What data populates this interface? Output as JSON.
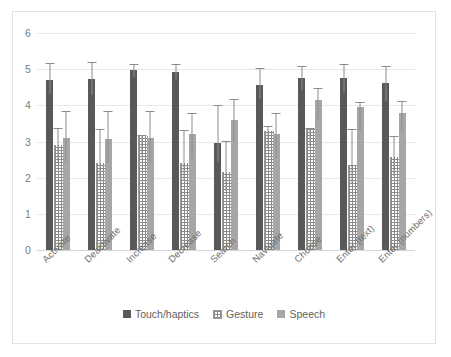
{
  "chart_data": {
    "type": "bar",
    "title": "",
    "subtitle": "",
    "xlabel": "",
    "ylabel": "",
    "ylim": [
      0,
      6
    ],
    "ytick_labels": [
      "0",
      "1",
      "2",
      "3",
      "4",
      "5",
      "6"
    ],
    "yticks": [
      0,
      1,
      2,
      3,
      4,
      5,
      6
    ],
    "grid": true,
    "legend_position": "bottom-center",
    "error_bars": true,
    "categories": [
      "Activate",
      "Deactivate",
      "Increase",
      "Decrease",
      "Search",
      "Navigate",
      "Choose",
      "Enter (text)",
      "Enter (numbers)"
    ],
    "series": [
      {
        "name": "Touch/haptics",
        "color": "#595959",
        "values": [
          4.7,
          4.72,
          4.97,
          4.93,
          2.97,
          4.57,
          4.75,
          4.75,
          4.62
        ],
        "err_low": [
          4.3,
          4.28,
          4.78,
          4.72,
          2.42,
          4.18,
          4.42,
          4.35,
          4.12
        ],
        "err_high": [
          5.18,
          5.2,
          5.15,
          5.13,
          4.02,
          5.02,
          5.1,
          5.13,
          5.1
        ]
      },
      {
        "name": "Gesture",
        "color": "#ffffff",
        "values": [
          2.9,
          2.4,
          3.15,
          2.4,
          2.15,
          3.3,
          3.35,
          2.35,
          2.58
        ],
        "err_low": [
          2.42,
          1.9,
          2.62,
          1.92,
          1.62,
          2.78,
          2.88,
          1.85,
          2.05
        ],
        "err_high": [
          3.38,
          3.35,
          3.18,
          3.32,
          3.02,
          3.42,
          3.38,
          3.35,
          3.15
        ]
      },
      {
        "name": "Speech",
        "color": "#a6a6a6",
        "values": [
          3.1,
          3.08,
          3.1,
          3.2,
          3.6,
          3.22,
          4.15,
          3.95,
          3.78
        ],
        "err_low": [
          2.42,
          2.4,
          2.42,
          2.55,
          3.02,
          2.55,
          3.62,
          3.28,
          3.28
        ],
        "err_high": [
          3.85,
          3.85,
          3.85,
          3.8,
          4.18,
          3.78,
          4.48,
          4.08,
          4.12
        ]
      }
    ],
    "legend": [
      {
        "label": "Touch/haptics",
        "swatch": "touch"
      },
      {
        "label": "Gesture",
        "swatch": "gesture"
      },
      {
        "label": "Speech",
        "swatch": "speech"
      }
    ]
  }
}
